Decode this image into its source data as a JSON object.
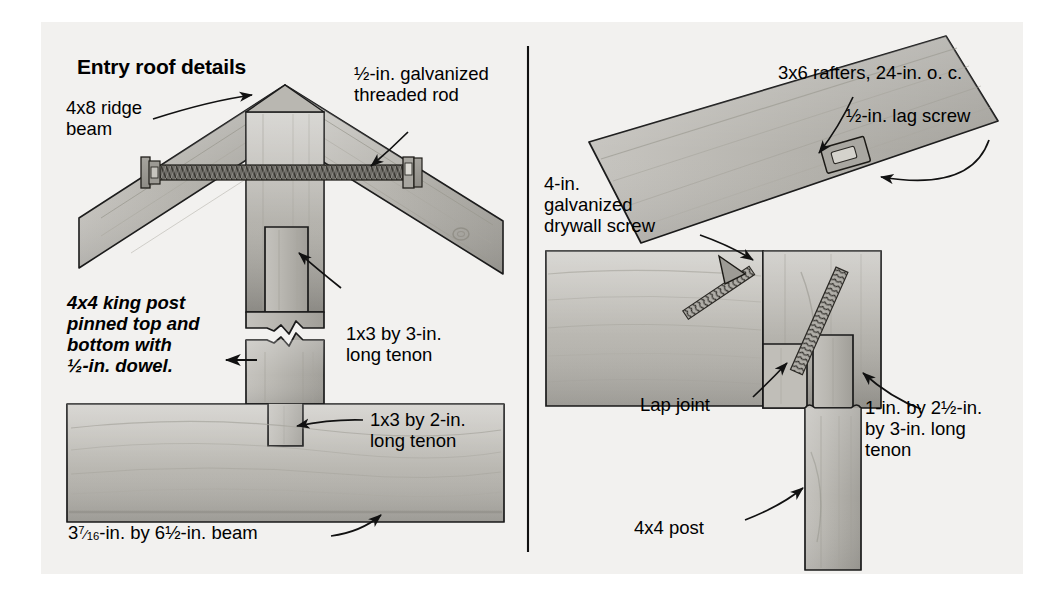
{
  "figure": {
    "title": "Entry roof details",
    "type": "technical-illustration",
    "panels": [
      "ridge-beam-king-post-detail",
      "post-to-beam-rafter-detail"
    ]
  },
  "left_panel": {
    "labels": {
      "title": "Entry roof details",
      "ridge_beam": "4x8 ridge\nbeam",
      "threaded_rod": "½-in. galvanized\nthreaded rod",
      "king_post": "4x4 king post\npinned top and\nbottom with\n½-in. dowel.",
      "tenon_upper": "1x3 by 3-in.\nlong tenon",
      "tenon_lower": "1x3 by 2-in.\nlong tenon",
      "beam_size_pre": "3",
      "beam_size_num": "7",
      "beam_size_den": "16",
      "beam_size_post": "-in. by 6½-in. beam"
    }
  },
  "right_panel": {
    "labels": {
      "rafters": "3x6 rafters, 24-in. o. c.",
      "lag_screw": "½-in. lag screw",
      "drywall_screw": "4-in.\ngalvanized\ndrywall screw",
      "lap_joint": "Lap joint",
      "tenon": "1-in. by 2½-in.\nby 3-in. long\ntenon",
      "post": "4x4 post"
    }
  },
  "colors": {
    "background": "#f2f1ef",
    "wood_light": "#d2d0cb",
    "wood_mid": "#b8b6b0",
    "wood_dark": "#9d9b95",
    "wood_shadow": "#86847e",
    "outline": "#1a1a1a",
    "text": "#000000",
    "divider": "#111111"
  }
}
